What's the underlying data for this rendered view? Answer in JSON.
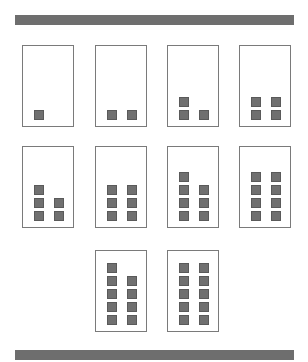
{
  "colors": {
    "bar": "#6e6e6e",
    "card_border": "#7a7a7a",
    "square_fill": "#707070",
    "square_border": "#5a5a5a",
    "background": "#ffffff"
  },
  "top_bar": {
    "x": 15,
    "y": 15,
    "w": 279,
    "h": 10
  },
  "bottom_bar": {
    "x": 15,
    "y": 350,
    "w": 279,
    "h": 10
  },
  "cards": [
    {
      "count": 1,
      "x": 22,
      "y": 45
    },
    {
      "count": 2,
      "x": 95,
      "y": 45
    },
    {
      "count": 3,
      "x": 167,
      "y": 45
    },
    {
      "count": 4,
      "x": 239,
      "y": 45
    },
    {
      "count": 5,
      "x": 22,
      "y": 146
    },
    {
      "count": 6,
      "x": 95,
      "y": 146
    },
    {
      "count": 7,
      "x": 167,
      "y": 146
    },
    {
      "count": 8,
      "x": 239,
      "y": 146
    },
    {
      "count": 9,
      "x": 95,
      "y": 250
    },
    {
      "count": 10,
      "x": 167,
      "y": 250
    }
  ]
}
